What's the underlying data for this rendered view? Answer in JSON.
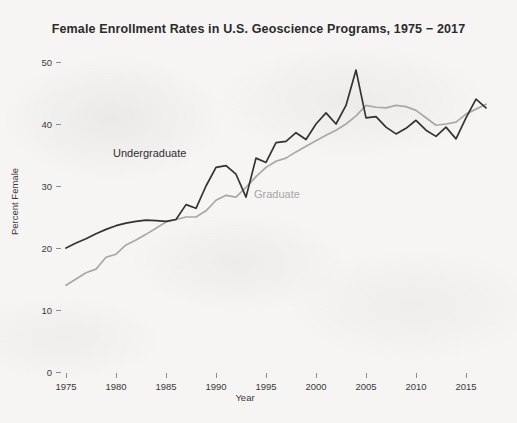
{
  "chart_data": {
    "type": "line",
    "title": "Female Enrollment Rates in U.S. Geoscience Programs, 1975 − 2017",
    "xlabel": "Year",
    "ylabel": "Percent Female",
    "xlim": [
      1974,
      2018
    ],
    "ylim": [
      0,
      50
    ],
    "grid": false,
    "legend_position": "inline-annotations",
    "xticks": [
      1975,
      1980,
      1985,
      1990,
      1995,
      2000,
      2005,
      2010,
      2015
    ],
    "yticks": [
      0,
      10,
      20,
      30,
      40,
      50
    ],
    "x": [
      1975,
      1976,
      1977,
      1978,
      1979,
      1980,
      1981,
      1982,
      1983,
      1984,
      1985,
      1986,
      1987,
      1988,
      1989,
      1990,
      1991,
      1992,
      1993,
      1994,
      1995,
      1996,
      1997,
      1998,
      1999,
      2000,
      2001,
      2002,
      2003,
      2004,
      2005,
      2006,
      2007,
      2008,
      2009,
      2010,
      2011,
      2012,
      2013,
      2014,
      2015,
      2016,
      2017
    ],
    "series": [
      {
        "name": "Undergraduate",
        "color": "#333333",
        "values": [
          20.0,
          20.8,
          21.5,
          22.3,
          23.0,
          23.6,
          24.0,
          24.3,
          24.5,
          24.4,
          24.3,
          24.6,
          27.0,
          26.4,
          30.0,
          33.0,
          33.3,
          31.9,
          28.2,
          34.5,
          33.8,
          37.0,
          37.2,
          38.6,
          37.5,
          40.0,
          41.8,
          40.0,
          43.0,
          48.7,
          41.0,
          41.2,
          39.5,
          38.4,
          39.3,
          40.6,
          39.0,
          38.0,
          39.5,
          37.6,
          41.0,
          44.0,
          42.6
        ]
      },
      {
        "name": "Graduate",
        "color": "#a8a8a8",
        "values": [
          14.0,
          15.0,
          16.0,
          16.6,
          18.5,
          19.0,
          20.5,
          21.3,
          22.2,
          23.2,
          24.2,
          24.6,
          25.0,
          25.0,
          26.0,
          27.7,
          28.5,
          28.2,
          29.8,
          31.5,
          33.0,
          34.0,
          34.5,
          35.5,
          36.4,
          37.3,
          38.2,
          39.0,
          40.0,
          41.3,
          43.0,
          42.7,
          42.6,
          43.0,
          42.8,
          42.2,
          41.0,
          39.8,
          40.0,
          40.3,
          41.6,
          42.4,
          43.2
        ]
      }
    ],
    "annotations": [
      {
        "text": "Undergraduate",
        "x": 1980,
        "y": 36
      },
      {
        "text": "Graduate",
        "x": 1994,
        "y": 29
      }
    ]
  },
  "axes": {
    "y_tick_labels": [
      "50",
      "40",
      "30",
      "20",
      "10",
      "0"
    ],
    "x_tick_labels": [
      "1975",
      "1980",
      "1985",
      "1990",
      "1995",
      "2000",
      "2005",
      "2010",
      "2015"
    ],
    "x_axis_title": "Year",
    "y_axis_title": "Percent Female"
  },
  "labels": {
    "undergraduate": "Undergraduate",
    "graduate": "Graduate"
  },
  "colors": {
    "undergraduate_line": "#333333",
    "graduate_line": "#a8a8a8",
    "background": "#f6f5f3",
    "text": "#2b2b2b"
  }
}
